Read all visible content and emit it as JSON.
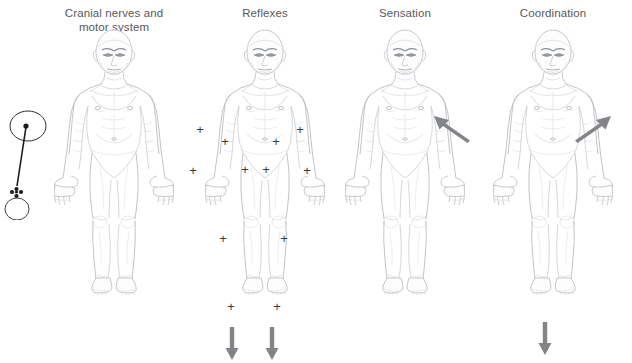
{
  "figure": {
    "caption": "",
    "background_color": "#ffffff",
    "line_color": "#b9bcc2",
    "text_color": "#58585a",
    "mark_color": "#3b3b3d",
    "arrow_color": "#828487"
  },
  "tool": {
    "name": "reflex-hammer",
    "label": "Reflex hammer"
  },
  "panels": [
    {
      "id": "cranial-nerves-motor-system",
      "title": "Cranial nerves and\nmotor system",
      "center_x": 114,
      "marks": [],
      "arrows": []
    },
    {
      "id": "reflexes",
      "title": "Reflexes",
      "center_x": 265,
      "marks": [
        {
          "label": "+",
          "x": 200,
          "y": 129
        },
        {
          "label": "+",
          "x": 225,
          "y": 141
        },
        {
          "label": "+",
          "x": 276,
          "y": 141
        },
        {
          "label": "+",
          "x": 300,
          "y": 129
        },
        {
          "label": "+",
          "x": 193,
          "y": 170
        },
        {
          "label": "+",
          "x": 245,
          "y": 169
        },
        {
          "label": "+",
          "x": 266,
          "y": 169
        },
        {
          "label": "+",
          "x": 307,
          "y": 170
        },
        {
          "label": "+",
          "x": 223,
          "y": 238
        },
        {
          "label": "+",
          "x": 284,
          "y": 238
        },
        {
          "label": "+",
          "x": 231,
          "y": 306
        },
        {
          "label": "+",
          "x": 277,
          "y": 306
        }
      ],
      "arrows": [
        {
          "type": "down",
          "x": 232,
          "y": 327
        },
        {
          "type": "down",
          "x": 272,
          "y": 327
        }
      ]
    },
    {
      "id": "sensation",
      "title": "Sensation",
      "center_x": 405,
      "marks": [],
      "arrows": []
    },
    {
      "id": "coordination",
      "title": "Coordination",
      "center_x": 553,
      "marks": [],
      "arrows": [
        {
          "type": "diagonal-up-left",
          "x": 452,
          "y": 128
        },
        {
          "type": "diagonal-up-right",
          "x": 593,
          "y": 128
        },
        {
          "type": "down",
          "x": 545,
          "y": 322
        }
      ]
    }
  ]
}
